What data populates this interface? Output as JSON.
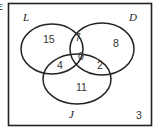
{
  "corner_symbol": "ε",
  "sets": {
    "L": {
      "label": "L"
    },
    "D": {
      "label": "D"
    },
    "J": {
      "label": "J"
    }
  },
  "regions": {
    "L_only": "15",
    "L_and_D_only": "7",
    "D_only": "8",
    "L_and_J_only": "4",
    "all_three": "0",
    "D_and_J_only": "2",
    "J_only": "11",
    "outside": "3"
  }
}
